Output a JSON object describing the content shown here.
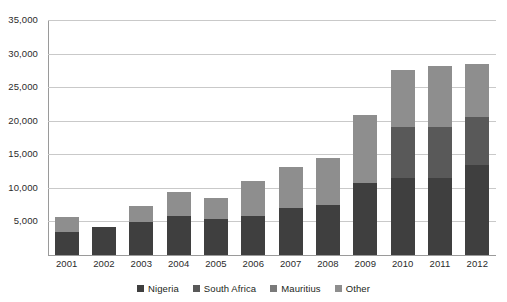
{
  "chart_data": {
    "type": "bar",
    "stacked": true,
    "title": "",
    "xlabel": "",
    "ylabel": "",
    "ylim": [
      0,
      35000
    ],
    "ytick_step": 5000,
    "ytick_labels": [
      "35,000",
      "30,000",
      "25,000",
      "20,000",
      "15,000",
      "10,000",
      "5,000"
    ],
    "ytick_values": [
      35000,
      30000,
      25000,
      20000,
      15000,
      10000,
      5000
    ],
    "grid": true,
    "legend_position": "bottom",
    "categories": [
      "2001",
      "2002",
      "2003",
      "2004",
      "2005",
      "2006",
      "2007",
      "2008",
      "2009",
      "2010",
      "2011",
      "2012"
    ],
    "series": [
      {
        "name": "Nigeria",
        "color": "#3f3f3f",
        "values": [
          3400,
          4200,
          4900,
          5800,
          5400,
          5800,
          7000,
          7500,
          10700,
          11500,
          11500,
          13400
        ]
      },
      {
        "name": "South Africa",
        "color": "#595959",
        "values": [
          0,
          0,
          0,
          0,
          0,
          0,
          0,
          0,
          0,
          7500,
          7500,
          7100
        ]
      },
      {
        "name": "Mauritius",
        "color": "#7a7a7a",
        "values": [
          0,
          0,
          0,
          0,
          0,
          0,
          0,
          0,
          0,
          0,
          0,
          0
        ]
      },
      {
        "name": "Other",
        "color": "#8e8e8e",
        "values": [
          2200,
          0,
          2400,
          3600,
          3100,
          5200,
          6100,
          7000,
          10200,
          8600,
          9100,
          7900
        ]
      }
    ],
    "totals": [
      5600,
      4200,
      7300,
      9400,
      8500,
      11000,
      13100,
      14500,
      20900,
      27600,
      28100,
      28400
    ]
  },
  "legend": {
    "items": [
      {
        "label": "Nigeria",
        "color": "#3f3f3f"
      },
      {
        "label": "South Africa",
        "color": "#595959"
      },
      {
        "label": "Mauritius",
        "color": "#7a7a7a"
      },
      {
        "label": "Other",
        "color": "#8e8e8e"
      }
    ]
  }
}
